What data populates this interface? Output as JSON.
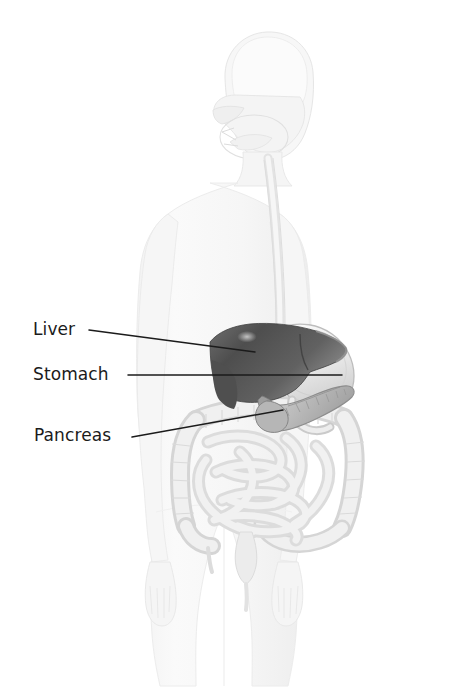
{
  "figure": {
    "background_color": "#ffffff",
    "body_outline_color": "#efefef",
    "organ_light_color": "#e2e2e2",
    "liver_color": "#5a5a5a",
    "leader_line_color": "#1b1b1b"
  },
  "labels": [
    {
      "id": "liver",
      "text": "Liver",
      "leader": {
        "x1": 89,
        "y1": 330,
        "x2": 255,
        "y2": 352
      }
    },
    {
      "id": "stomach",
      "text": "Stomach",
      "leader": {
        "x1": 128,
        "y1": 375,
        "x2": 342,
        "y2": 375
      }
    },
    {
      "id": "pancreas",
      "text": "Pancreas",
      "leader": {
        "x1": 132,
        "y1": 437,
        "x2": 283,
        "y2": 410
      }
    }
  ],
  "anatomy": {
    "head": "head-outline",
    "nasal_cavity": "nasal-cavity",
    "oral_cavity": "oral-cavity",
    "esophagus": "esophagus",
    "liver": "liver-organ",
    "stomach": "stomach-organ",
    "pancreas": "pancreas-organ",
    "large_intestine": "large-intestine",
    "small_intestine": "small-intestine",
    "rectum": "rectum",
    "torso": "torso-outline",
    "arms": "arms-outline",
    "legs": "legs-outline"
  }
}
